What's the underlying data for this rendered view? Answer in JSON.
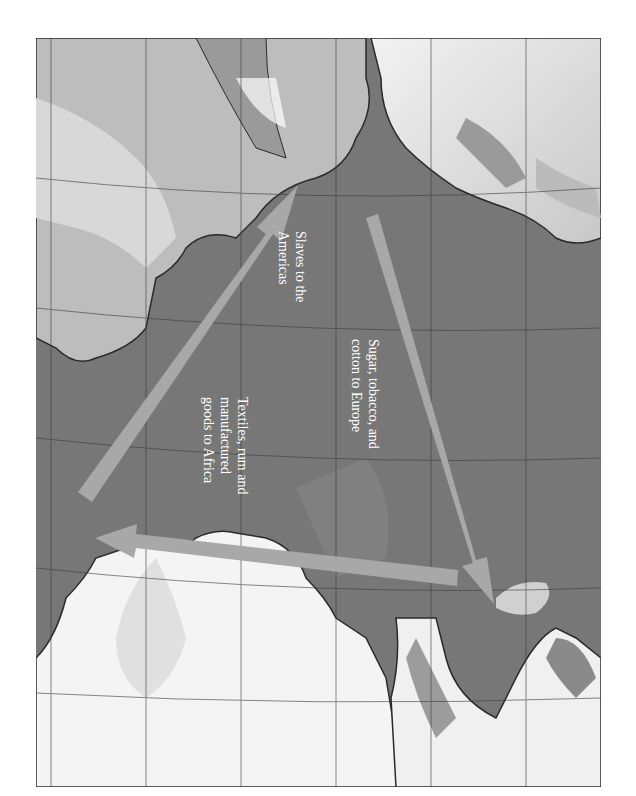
{
  "map": {
    "subject": "Triangular Trade across the Atlantic Ocean",
    "orientation": "rotated 90 degrees clockwise",
    "colors": {
      "ocean": "#6e6e6e",
      "land": "#e8e8e8",
      "coast": "#2a2a2a",
      "arrow": "#a8a8a8",
      "label_text": "#ffffff",
      "grid": "#3c3c3c"
    },
    "routes": [
      {
        "id": "africa-to-americas",
        "label_lines": [
          "Slaves to the",
          "Americas"
        ]
      },
      {
        "id": "americas-to-europe",
        "label_lines": [
          "Sugar, tobacco, and",
          "cotton to Europe"
        ]
      },
      {
        "id": "europe-to-africa",
        "label_lines": [
          "Textiles, rum and",
          "manufactured",
          "goods to Africa"
        ]
      }
    ]
  },
  "labels": {
    "slaves": "Slaves to the\nAmericas",
    "sugar": "Sugar, tobacco, and\ncotton to Europe",
    "textiles": "Textiles, rum and\nmanufactured\ngoods to Africa"
  }
}
